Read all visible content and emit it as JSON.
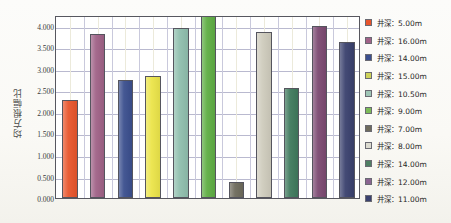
{
  "chart_data": {
    "type": "bar",
    "title": "",
    "xlabel": "",
    "ylabel": "均方根幅比",
    "ylim": [
      0,
      4.25
    ],
    "ytick_step": 0.5,
    "grid": true,
    "legend_position": "right",
    "ytick_labels": [
      "4.000",
      "3.500",
      "3.000",
      "2.500",
      "2.000",
      "1.500",
      "1.000",
      "0.500",
      "0.000"
    ],
    "ytick_values": [
      4.0,
      3.5,
      3.0,
      2.5,
      2.0,
      1.5,
      1.0,
      0.5,
      0.0
    ],
    "categories": [
      "井深：5.00m",
      "井深：16.00m",
      "井深：14.00m",
      "井深：15.00m",
      "井深：10.50m",
      "井深：9.00m",
      "井深：7.00m",
      "井深：8.00m",
      "井深：14.00m",
      "井深：12.00m",
      "井深：11.00m"
    ],
    "values": [
      2.25,
      3.78,
      2.72,
      2.8,
      3.92,
      4.25,
      0.35,
      3.83,
      2.53,
      3.97,
      3.6
    ],
    "colors": [
      "#e8552c",
      "#a06287",
      "#3b4f8e",
      "#ece54a",
      "#90bfae",
      "#5fae44",
      "#6e6b5c",
      "#cfccbd",
      "#3f7a5d",
      "#7c4a72",
      "#3a416e"
    ]
  },
  "legend": {
    "items": [
      {
        "label": "井深：5.00m",
        "color": "#e8552c"
      },
      {
        "label": "井深：16.00m",
        "color": "#a06287"
      },
      {
        "label": "井深：14.00m",
        "color": "#3b4f8e"
      },
      {
        "label": "井深：15.00m",
        "color": "#ced35a"
      },
      {
        "label": "井深：10.50m",
        "color": "#9fc6b6"
      },
      {
        "label": "井深：9.00m",
        "color": "#7cbb58"
      },
      {
        "label": "井深：7.00m",
        "color": "#6e6b5c"
      },
      {
        "label": "井深：8.00m",
        "color": "#dcdbd0"
      },
      {
        "label": "井深：14.00m",
        "color": "#4f7f63"
      },
      {
        "label": "井深：12.00m",
        "color": "#8a6490"
      },
      {
        "label": "井深：11.00m",
        "color": "#3a416e"
      }
    ]
  },
  "axes": {
    "y_title": "均方根幅比"
  }
}
